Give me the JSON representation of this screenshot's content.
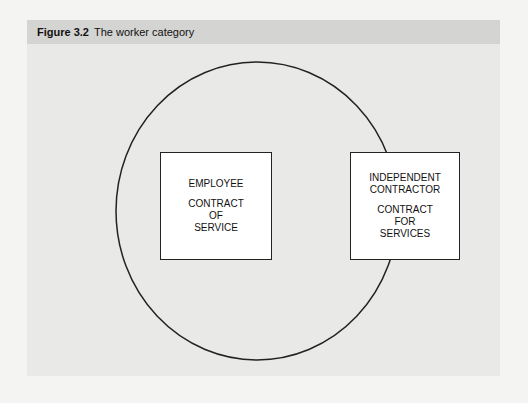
{
  "figure": {
    "number": "Figure 3.2",
    "title": "The worker category"
  },
  "diagram": {
    "circle_label": "worker category",
    "employee_box": {
      "heading": [
        "EMPLOYEE"
      ],
      "contract": [
        "CONTRACT",
        "OF",
        "SERVICE"
      ]
    },
    "contractor_box": {
      "heading": [
        "INDEPENDENT",
        "CONTRACTOR"
      ],
      "contract": [
        "CONTRACT",
        "FOR",
        "SERVICES"
      ]
    }
  },
  "colors": {
    "panel_bg": "#e9e9e7",
    "title_bg": "#d4d4d2",
    "stroke": "#222222",
    "box_fill": "#ffffff"
  }
}
